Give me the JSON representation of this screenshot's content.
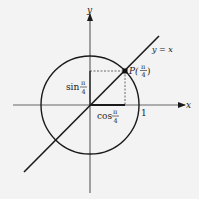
{
  "diagram": {
    "colors": {
      "background": "#f3f3f3",
      "ink": "#1a1a1a",
      "axis": "#555555",
      "dashed": "#444444"
    },
    "axes": {
      "x_label": "x",
      "y_label": "y"
    },
    "circle": {
      "radius_label": "1"
    },
    "line": {
      "label": "y = x"
    },
    "point": {
      "label_prefix": "P(",
      "label_num": "π",
      "label_den": "4",
      "label_suffix": ")"
    },
    "sin_label": {
      "fn": "sin",
      "num": "π",
      "den": "4"
    },
    "cos_label": {
      "fn": "cos",
      "num": "π",
      "den": "4"
    }
  }
}
